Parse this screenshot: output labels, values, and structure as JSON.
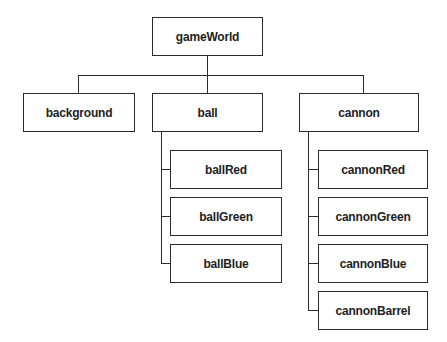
{
  "diagram": {
    "type": "tree",
    "root": {
      "label": "gameWorld",
      "children": [
        {
          "label": "background",
          "children": []
        },
        {
          "label": "ball",
          "children": [
            {
              "label": "ballRed"
            },
            {
              "label": "ballGreen"
            },
            {
              "label": "ballBlue"
            }
          ]
        },
        {
          "label": "cannon",
          "children": [
            {
              "label": "cannonRed"
            },
            {
              "label": "cannonGreen"
            },
            {
              "label": "cannonBlue"
            },
            {
              "label": "cannonBarrel"
            }
          ]
        }
      ]
    }
  },
  "nodes": {
    "gameWorld": "gameWorld",
    "background": "background",
    "ball": "ball",
    "cannon": "cannon",
    "ballRed": "ballRed",
    "ballGreen": "ballGreen",
    "ballBlue": "ballBlue",
    "cannonRed": "cannonRed",
    "cannonGreen": "cannonGreen",
    "cannonBlue": "cannonBlue",
    "cannonBarrel": "cannonBarrel"
  },
  "colors": {
    "line": "#2a2a2a",
    "text": "#1e1e1e",
    "background": "#ffffff"
  }
}
